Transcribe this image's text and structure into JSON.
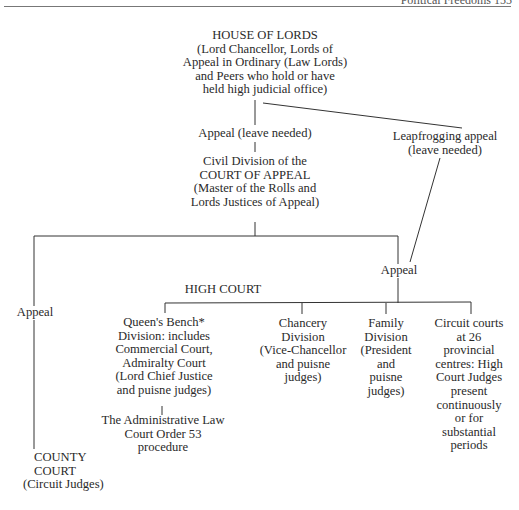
{
  "page_header": {
    "running_title": "Political Freedoms   155"
  },
  "nodes": {
    "house_of_lords": {
      "lines": [
        "HOUSE OF LORDS",
        "(Lord Chancellor, Lords of",
        "Appeal in Ordinary (Law Lords)",
        "and Peers who hold or have",
        "held high judicial office)"
      ]
    },
    "appeal_leave_needed": {
      "lines": [
        "Appeal (leave needed)"
      ]
    },
    "leapfrogging_appeal": {
      "lines": [
        "Leapfrogging appeal",
        "(leave needed)"
      ]
    },
    "court_of_appeal": {
      "lines": [
        "Civil Division of the",
        "COURT OF APPEAL",
        "(Master of the Rolls and",
        "Lords Justices of Appeal)"
      ]
    },
    "appeal_right": {
      "lines": [
        "Appeal"
      ]
    },
    "appeal_left": {
      "lines": [
        "Appeal"
      ]
    },
    "high_court": {
      "lines": [
        "HIGH COURT"
      ]
    },
    "queens_bench": {
      "lines": [
        "Queen's Bench*",
        "Division: includes",
        "Commercial Court,",
        "Admiralty Court",
        "(Lord Chief Justice",
        "and puisne judges)"
      ]
    },
    "administrative_law_court": {
      "lines": [
        "The Administrative Law",
        "Court Order 53",
        "procedure"
      ]
    },
    "chancery_division": {
      "lines": [
        "Chancery",
        "Division",
        "(Vice-Chancellor",
        "and puisne",
        "judges)"
      ]
    },
    "family_division": {
      "lines": [
        "Family",
        "Division",
        "(President",
        "and",
        "puisne",
        "judges)"
      ]
    },
    "circuit_courts": {
      "lines": [
        "Circuit courts",
        "at 26",
        "provincial",
        "centres: High",
        "Court Judges",
        "present",
        "continuously",
        "or for",
        "substantial",
        "periods"
      ]
    },
    "county_court": {
      "lines": [
        "COUNTY",
        "COURT",
        "(Circuit Judges)"
      ]
    }
  }
}
